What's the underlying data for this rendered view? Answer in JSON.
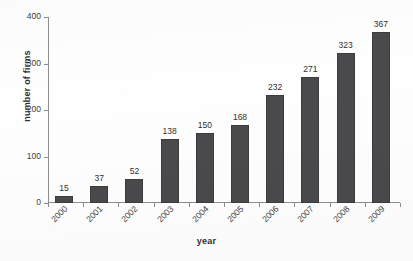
{
  "chart_data": {
    "type": "bar",
    "title": "",
    "xlabel": "year",
    "ylabel": "number of firms",
    "categories": [
      "2000",
      "2001",
      "2002",
      "2003",
      "2004",
      "2005",
      "2006",
      "2007",
      "2008",
      "2009"
    ],
    "values": [
      15,
      37,
      52,
      138,
      150,
      168,
      232,
      271,
      323,
      367
    ],
    "data_labels": [
      "15",
      "37",
      "52",
      "138",
      "150",
      "168",
      "232",
      "271",
      "323",
      "367"
    ],
    "ylim": [
      0,
      400
    ],
    "yticks": [
      0,
      100,
      200,
      300,
      400
    ],
    "ytick_labels": [
      "0",
      "100",
      "200",
      "300",
      "400"
    ],
    "grid": false,
    "legend": null,
    "legend_position": "none",
    "series": [
      {
        "name": "number of firms",
        "values": [
          15,
          37,
          52,
          138,
          150,
          168,
          232,
          271,
          323,
          367
        ],
        "color": "#4a4a4d"
      }
    ],
    "bar_color": "#4a4a4d",
    "axis_color": "#8e8e90",
    "text_color": "#3d3d3f",
    "background": "#fefefe",
    "xtick_label_rotation": -45
  }
}
